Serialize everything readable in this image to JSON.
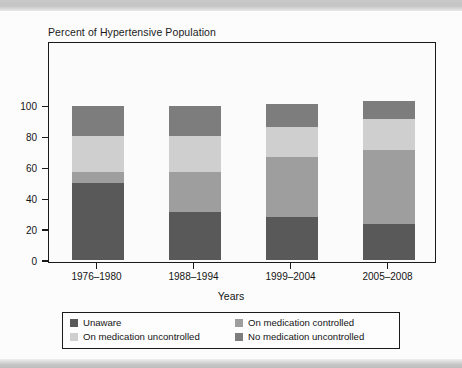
{
  "chart_title": "Percent of Hypertensive Population",
  "axis": {
    "x_title": "Years",
    "y_ticks": [
      "0",
      "20",
      "40",
      "60",
      "80",
      "100"
    ]
  },
  "legend": {
    "items": [
      {
        "label": "Unaware",
        "color": "#595959"
      },
      {
        "label": "On medication controlled",
        "color": "#9e9e9e"
      },
      {
        "label": "On medication uncontrolled",
        "color": "#cfcfcf"
      },
      {
        "label": "No medication uncontrolled",
        "color": "#7d7d7d"
      }
    ]
  },
  "chart_data": {
    "type": "bar",
    "subtype": "stacked-vertical",
    "title": "Percent of Hypertensive Population",
    "xlabel": "Years",
    "ylabel": "",
    "ylim": [
      0,
      100
    ],
    "yticks": [
      0,
      20,
      40,
      60,
      80,
      100
    ],
    "grid": false,
    "legend_position": "bottom",
    "categories": [
      "1976–1980",
      "1988–1994",
      "1999–2004",
      "2005–2008"
    ],
    "series": [
      {
        "name": "Unaware",
        "color": "#595959",
        "values": [
          50,
          31,
          28,
          23
        ]
      },
      {
        "name": "On medication controlled",
        "color": "#9e9e9e",
        "values": [
          7,
          26,
          39,
          48
        ]
      },
      {
        "name": "On medication uncontrolled",
        "color": "#cfcfcf",
        "values": [
          23,
          23,
          19,
          20
        ]
      },
      {
        "name": "No medication uncontrolled",
        "color": "#7d7d7d",
        "values": [
          20,
          20,
          15,
          12
        ]
      }
    ],
    "totals": [
      100,
      100,
      101,
      103
    ]
  }
}
